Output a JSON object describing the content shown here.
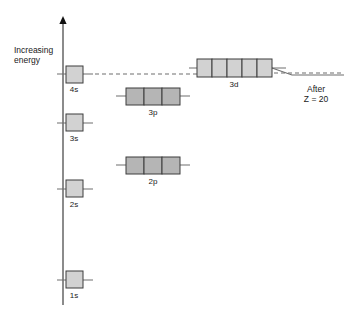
{
  "figure": {
    "type": "orbital-energy-level-diagram",
    "background": "#ffffff",
    "width": 346,
    "height": 315
  },
  "axis": {
    "name": "energy-axis",
    "label": "Increasing\nenergy",
    "orientation": "vertical",
    "arrow_at": "top",
    "x": 63,
    "y_top": 16,
    "y_bottom": 305,
    "color": "#6e6e6e"
  },
  "annotation": {
    "after_label": "After\nZ = 20"
  },
  "colors": {
    "s_d_box_fill": "#d2d2d2",
    "p_box_fill": "#b5b5b5",
    "box_stroke": "#3c3c3c",
    "level_line": "#6e6e6e",
    "dashed_line": "#6e6e6e",
    "text": "#1a1a1a"
  },
  "chart_data": {
    "type": "diagram",
    "title": "",
    "ylabel": "Increasing energy",
    "orbitals": [
      {
        "label": "1s",
        "type": "s",
        "boxes": 1,
        "box_x": 66,
        "box_y": 271,
        "box_w": 17,
        "box_h": 17,
        "line_y": 280,
        "line_x1": 57,
        "line_x2": 93,
        "label_x": 74,
        "label_y": 291,
        "fill": "#d2d2d2"
      },
      {
        "label": "2s",
        "type": "s",
        "boxes": 1,
        "box_x": 66,
        "box_y": 180,
        "box_w": 17,
        "box_h": 17,
        "line_y": 189,
        "line_x1": 57,
        "line_x2": 93,
        "label_x": 74,
        "label_y": 200,
        "fill": "#d2d2d2"
      },
      {
        "label": "2p",
        "type": "p",
        "boxes": 3,
        "box_x": 126,
        "box_y": 157,
        "box_w": 18,
        "box_h": 17,
        "line_y": 165,
        "line_x1": 116,
        "line_x2": 190,
        "label_x": 153,
        "label_y": 177,
        "fill": "#b5b5b5"
      },
      {
        "label": "3s",
        "type": "s",
        "boxes": 1,
        "box_x": 66,
        "box_y": 114,
        "box_w": 17,
        "box_h": 17,
        "line_y": 123,
        "line_x1": 57,
        "line_x2": 93,
        "label_x": 74,
        "label_y": 134,
        "fill": "#d2d2d2"
      },
      {
        "label": "3p",
        "type": "p",
        "boxes": 3,
        "box_x": 126,
        "box_y": 88,
        "box_w": 18,
        "box_h": 17,
        "line_y": 96,
        "line_x1": 116,
        "line_x2": 190,
        "label_x": 153,
        "label_y": 108,
        "fill": "#b5b5b5"
      },
      {
        "label": "4s",
        "type": "s",
        "boxes": 1,
        "box_x": 66,
        "box_y": 66,
        "box_w": 17,
        "box_h": 17,
        "line_y": 74,
        "line_x1": 57,
        "line_x2": 93,
        "label_x": 74,
        "label_y": 85,
        "fill": "#d2d2d2"
      },
      {
        "label": "3d",
        "type": "d",
        "boxes": 5,
        "box_x": 197,
        "box_y": 59,
        "box_w": 15,
        "box_h": 18,
        "line_y": 68,
        "line_x1": 189,
        "line_x2": 286,
        "label_x": 234,
        "label_y": 80,
        "fill": "#d2d2d2"
      }
    ],
    "connector_dashed": {
      "name": "4s-to-3d-dashed-connector",
      "x1": 95,
      "y1": 74,
      "x2": 197,
      "y2": 74,
      "dash": "4 3"
    },
    "crossover_line": {
      "name": "after-z20-crossover-line",
      "points": "272,68 292,75 344,75",
      "style": "solid"
    },
    "trailing_dashed": {
      "name": "trailing-dashed-level",
      "x1": 274,
      "y1": 73,
      "x2": 344,
      "y2": 73,
      "dash": "4 3"
    }
  }
}
